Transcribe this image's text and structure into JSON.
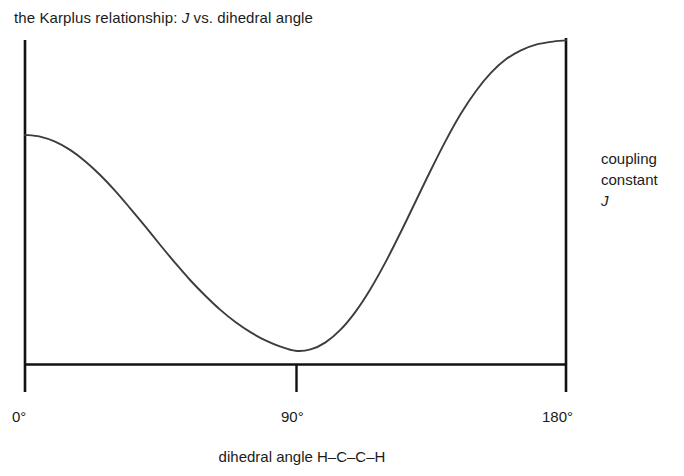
{
  "chart_data": {
    "type": "line",
    "title": "the Karplus relationship: J vs. dihedral angle",
    "title_plain": "the Karplus relationship: ",
    "title_italic": "J",
    "title_tail": " vs. dihedral angle",
    "xlabel": "dihedral angle H–C–C–H",
    "ylabel_line1": "coupling",
    "ylabel_line2": "constant",
    "ylabel_line3": "J",
    "xtick_labels": [
      "0°",
      "90°",
      "180°"
    ],
    "xticks": [
      0,
      90,
      180
    ],
    "xlim": [
      0,
      180
    ],
    "ylim": [
      0,
      11.5
    ],
    "grid": false,
    "legend": false,
    "legend_position": "none",
    "axis_color": "#111111",
    "curve_color": "#3d3d3d",
    "background_color": "#ffffff",
    "series": [
      {
        "name": "coupling constant J",
        "x": [
          0,
          5,
          10,
          15,
          20,
          25,
          30,
          35,
          40,
          45,
          50,
          55,
          60,
          65,
          70,
          75,
          80,
          85,
          90,
          95,
          100,
          105,
          110,
          115,
          120,
          125,
          130,
          135,
          140,
          145,
          150,
          155,
          160,
          165,
          170,
          175,
          180
        ],
        "values": [
          8.1,
          8.04,
          7.86,
          7.57,
          7.17,
          6.68,
          6.12,
          5.5,
          4.86,
          4.2,
          3.56,
          2.95,
          2.4,
          1.9,
          1.47,
          1.11,
          0.82,
          0.6,
          0.45,
          0.5,
          0.75,
          1.2,
          1.84,
          2.65,
          3.6,
          4.65,
          5.75,
          6.85,
          7.9,
          8.85,
          9.65,
          10.3,
          10.78,
          11.1,
          11.3,
          11.4,
          11.45
        ]
      }
    ],
    "annotations": [
      {
        "name": "minimum",
        "x": 90,
        "y": 0,
        "note": "curve touches the x axis at 90 degrees"
      },
      {
        "name": "anti-maximum",
        "x": 180,
        "y": 11.45,
        "note": "largest coupling at 180 degrees"
      },
      {
        "name": "syn-maximum",
        "x": 0,
        "y": 8.1,
        "note": "coupling at 0 degrees, lower than at 180"
      }
    ]
  },
  "chart": {
    "title_plain": "the Karplus relationship: ",
    "title_italic": "J",
    "title_tail": " vs. dihedral angle",
    "y_label_line1": "coupling",
    "y_label_line2": "constant",
    "y_label_line3": "J",
    "x_label": "dihedral angle H–C–C–H",
    "x_tick_0": "0°",
    "x_tick_90": "90°",
    "x_tick_180": "180°"
  }
}
